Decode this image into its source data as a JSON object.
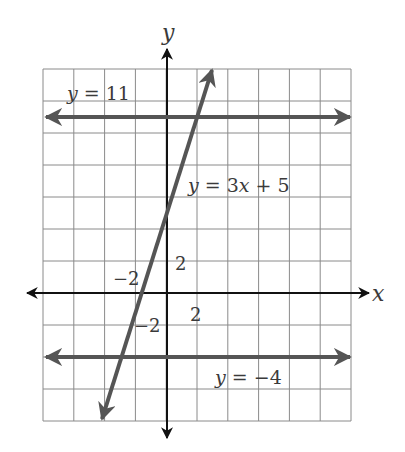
{
  "chart_data": {
    "type": "line",
    "title": "",
    "xlabel": "x",
    "ylabel": "y",
    "grid": true,
    "grid_step": 2,
    "xlim": [
      -8,
      12
    ],
    "ylim": [
      -8,
      14
    ],
    "tick_labels": {
      "x": [
        {
          "value": -2,
          "text": "−2"
        },
        {
          "value": 2,
          "text": "2"
        }
      ],
      "y": [
        {
          "value": -2,
          "text": "−2"
        },
        {
          "value": 2,
          "text": "2"
        }
      ]
    },
    "series": [
      {
        "name": "y = 11",
        "kind": "horizontal",
        "equation": "y = 11",
        "slope": 0,
        "intercept": 11,
        "x_range": [
          -8,
          12
        ]
      },
      {
        "name": "y = 3x + 5",
        "kind": "linear",
        "equation": "y = 3x + 5",
        "slope": 3,
        "intercept": 5,
        "x_range": [
          -4.3,
          3.0
        ]
      },
      {
        "name": "y = −4",
        "kind": "horizontal",
        "equation": "y = -4",
        "slope": 0,
        "intercept": -4,
        "x_range": [
          -8,
          12
        ]
      }
    ],
    "annotations": [
      {
        "text": "y = 11",
        "near": "upper-left, above line y=11"
      },
      {
        "text": "y = 3x + 5",
        "near": "right of slanted line"
      },
      {
        "text": "y = −4",
        "near": "below line y=-4, right of y-axis"
      }
    ]
  },
  "labels": {
    "x_axis": "x",
    "y_axis": "y",
    "tick_x_neg2": "−2",
    "tick_x_2": "2",
    "tick_y_2": "2",
    "tick_y_neg2": "−2",
    "eq_top": "y = 11",
    "eq_slant": "y = 3x + 5",
    "eq_bottom": "y = −4"
  },
  "colors": {
    "grid": "#8a8a8a",
    "axes": "#111111",
    "lines": "#555555",
    "text": "#3a3a3a"
  }
}
